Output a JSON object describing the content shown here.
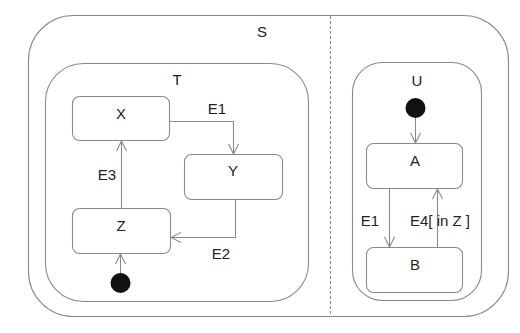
{
  "diagram": {
    "type": "UML state machine",
    "colors": {
      "line": "#8a8a8a",
      "text": "#222222",
      "initial": "#111111",
      "background": "#ffffff"
    },
    "states": {
      "S": {
        "label": "S",
        "regions": [
          "left",
          "right"
        ],
        "region_separator": "dashed"
      },
      "T": {
        "label": "T",
        "parent": "S",
        "region": "left"
      },
      "U": {
        "label": "U",
        "parent": "S",
        "region": "right"
      },
      "X": {
        "label": "X",
        "parent": "T"
      },
      "Y": {
        "label": "Y",
        "parent": "T"
      },
      "Z": {
        "label": "Z",
        "parent": "T"
      },
      "A": {
        "label": "A",
        "parent": "U"
      },
      "B": {
        "label": "B",
        "parent": "U"
      }
    },
    "transitions": [
      {
        "from": "X",
        "to": "Y",
        "label": "E1"
      },
      {
        "from": "Y",
        "to": "Z",
        "label": "E2"
      },
      {
        "from": "Z",
        "to": "X",
        "label": "E3"
      },
      {
        "from": "A",
        "to": "B",
        "label": "E1"
      },
      {
        "from": "B",
        "to": "A",
        "label": "E4[ in Z ]"
      },
      {
        "from": "initial-T",
        "to": "Z",
        "label": ""
      },
      {
        "from": "initial-U",
        "to": "A",
        "label": ""
      }
    ]
  }
}
